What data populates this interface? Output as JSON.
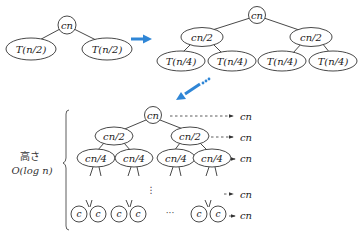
{
  "diagram": {
    "accent_color": "#2f86d6",
    "stage1": {
      "root": "cn",
      "children": [
        "T(n/2)",
        "T(n/2)"
      ]
    },
    "stage2": {
      "root": "cn",
      "level1": [
        "cn/2",
        "cn/2"
      ],
      "level2": [
        "T(n/4)",
        "T(n/4)",
        "T(n/4)",
        "T(n/4)"
      ]
    },
    "stage3": {
      "root": "cn",
      "level1": [
        "cn/2",
        "cn/2"
      ],
      "level2": [
        "cn/4",
        "cn/4",
        "cn/4",
        "cn/4"
      ],
      "vertical_ellipsis": "⋮",
      "leaves": [
        "c",
        "c",
        "c",
        "c",
        "c",
        "c"
      ],
      "leaf_ellipsis": "···",
      "level_costs": [
        "cn",
        "cn",
        "cn",
        "cn",
        "cn"
      ],
      "height_label_line1": "高さ",
      "height_label_line2": "O(log n)"
    },
    "arrows": [
      {
        "from": "stage1",
        "to": "stage2",
        "style": "solid",
        "direction": "right"
      },
      {
        "from": "stage2",
        "to": "stage3",
        "style": "dotted-tail",
        "direction": "down-left"
      }
    ]
  }
}
